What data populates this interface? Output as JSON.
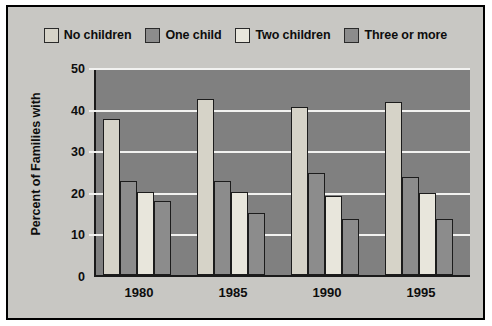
{
  "chart_data": {
    "type": "bar",
    "title": "",
    "xlabel": "",
    "ylabel": "Percent of Families with",
    "categories": [
      "1980",
      "1985",
      "1990",
      "1995"
    ],
    "ylim": [
      0,
      50
    ],
    "yticks": [
      0,
      10,
      20,
      30,
      40,
      50
    ],
    "ytick_labels": [
      "0",
      "10",
      "20",
      "30",
      "40",
      "50"
    ],
    "grid": true,
    "legend_position": "top",
    "series": [
      {
        "name": "No children",
        "color": "#d6d3c8",
        "values": [
          37.5,
          42.3,
          40.5,
          41.5
        ]
      },
      {
        "name": "One child",
        "color": "#8c8c8c",
        "values": [
          22.5,
          22.5,
          24.5,
          23.5
        ]
      },
      {
        "name": "Two children",
        "color": "#e8e6dc",
        "values": [
          20.0,
          20.0,
          19.0,
          19.8
        ]
      },
      {
        "name": "Three or more",
        "color": "#8c8c8c",
        "values": [
          17.8,
          15.0,
          13.5,
          13.5
        ]
      }
    ]
  },
  "figure": {
    "background": "#c8c7c3",
    "plot_background": "#808080",
    "frame_color": "#000000",
    "gridline_color": "#f2f2f0"
  }
}
